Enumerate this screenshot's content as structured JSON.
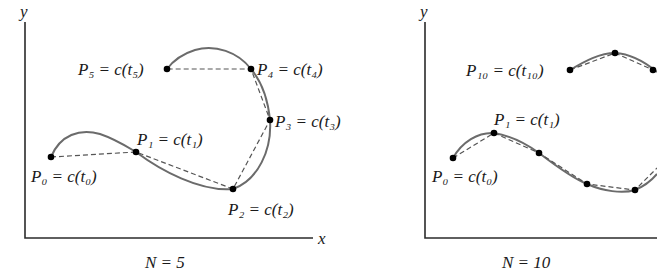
{
  "figure": {
    "panels": [
      {
        "id": "n5",
        "caption": "N = 5",
        "axes": {
          "x_label": "x",
          "y_label": "y"
        },
        "points": [
          {
            "name": "P0",
            "label": "P₀ = c(t₀)",
            "x": 51,
            "y": 157
          },
          {
            "name": "P1",
            "label": "P₁ = c(t₁)",
            "x": 136,
            "y": 152
          },
          {
            "name": "P2",
            "label": "P₂ = c(t₂)",
            "x": 233,
            "y": 189
          },
          {
            "name": "P3",
            "label": "P₃ = c(t₃)",
            "x": 270,
            "y": 120
          },
          {
            "name": "P4",
            "label": "P₄ = c(t₄)",
            "x": 251,
            "y": 69
          },
          {
            "name": "P5",
            "label": "P₅ = c(t₅)",
            "x": 167,
            "y": 69
          }
        ]
      },
      {
        "id": "n10",
        "caption": "N = 10",
        "axes": {
          "x_label": "",
          "y_label": "y"
        },
        "points": [
          {
            "name": "P0",
            "label": "P₀ = c(t₀)",
            "x": 453,
            "y": 158
          },
          {
            "name": "P1",
            "label": "P₁ = c(t₁)",
            "x": 494,
            "y": 133
          },
          {
            "name": "P2",
            "label": "",
            "x": 539,
            "y": 153
          },
          {
            "name": "P3",
            "label": "",
            "x": 587,
            "y": 184
          },
          {
            "name": "P4",
            "label": "",
            "x": 635,
            "y": 190
          },
          {
            "name": "P8",
            "label": "",
            "x": 653,
            "y": 70
          },
          {
            "name": "P9",
            "label": "",
            "x": 615,
            "y": 53
          },
          {
            "name": "P10",
            "label": "P₁₀ = c(t₁₀)",
            "x": 570,
            "y": 70
          }
        ]
      }
    ],
    "colors": {
      "curve": "#6b6b6b",
      "chord": "#555555",
      "axis": "#2b2b2b",
      "point": "#000000"
    }
  }
}
